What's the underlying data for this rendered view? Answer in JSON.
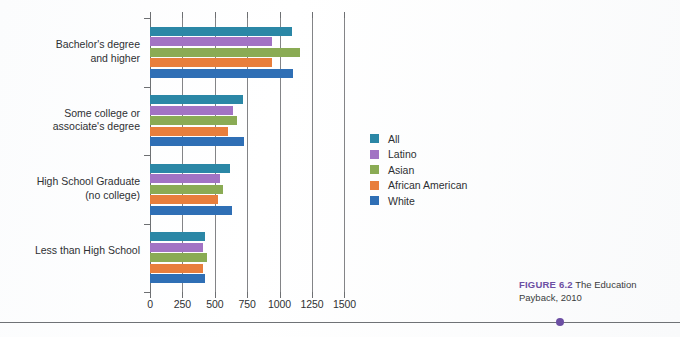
{
  "figure": {
    "caption_number": "FIGURE 6.2",
    "caption_text": "The Education Payback, 2010"
  },
  "chart_data": {
    "type": "bar",
    "orientation": "horizontal",
    "title": "The Education Payback, 2010",
    "xlabel": "",
    "ylabel": "",
    "xlim": [
      0,
      1500
    ],
    "xticks": [
      0,
      250,
      500,
      750,
      1000,
      1250,
      1500
    ],
    "xtick_labels": [
      "0",
      "250",
      "500",
      "750",
      "1000",
      "1250",
      "1500"
    ],
    "grid": true,
    "legend_position": "right",
    "categories": [
      "Bachelor's degree\nand higher",
      "Some college or\nassociate's degree",
      "High School Graduate\n(no college)",
      "Less than High School"
    ],
    "series": [
      {
        "name": "All",
        "color": "#2b87a6",
        "values": [
          1095,
          720,
          620,
          425
        ]
      },
      {
        "name": "Latino",
        "color": "#a273c4",
        "values": [
          940,
          640,
          540,
          410
        ]
      },
      {
        "name": "Asian",
        "color": "#8aab54",
        "values": [
          1160,
          670,
          565,
          440
        ]
      },
      {
        "name": "African American",
        "color": "#e87e3c",
        "values": [
          940,
          605,
          525,
          410
        ]
      },
      {
        "name": "White",
        "color": "#2f6fb5",
        "values": [
          1100,
          725,
          635,
          425
        ]
      }
    ]
  }
}
